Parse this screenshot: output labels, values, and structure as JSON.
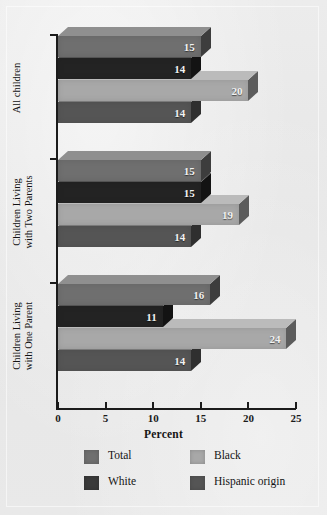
{
  "chart_data": {
    "type": "bar",
    "orientation": "horizontal",
    "title": "",
    "xlabel": "Percent",
    "ylabel": "",
    "xlim": [
      0,
      25
    ],
    "xticks": [
      0,
      5,
      10,
      15,
      20,
      25
    ],
    "grid": false,
    "legend_position": "bottom",
    "categories": [
      "All children",
      "Children Living\nwith Two Parents",
      "Children Living\nwith One Parent"
    ],
    "series": [
      {
        "name": "Total",
        "color": "#6f6f6f",
        "values": [
          15,
          15,
          16
        ]
      },
      {
        "name": "White",
        "color": "#232323",
        "values": [
          14,
          15,
          11
        ]
      },
      {
        "name": "Black",
        "color": "#a8a8a8",
        "values": [
          20,
          19,
          24
        ]
      },
      {
        "name": "Hispanic origin",
        "color": "#555555",
        "values": [
          14,
          14,
          14
        ]
      }
    ],
    "legend_entries": [
      {
        "label": "Total",
        "color": "#6f6f6f"
      },
      {
        "label": "Black",
        "color": "#a8a8a8"
      },
      {
        "label": "White",
        "color": "#3a3a3a"
      },
      {
        "label": "Hispanic origin",
        "color": "#555555"
      }
    ],
    "data_labels": [
      [
        15,
        14,
        20,
        14
      ],
      [
        15,
        15,
        19,
        14
      ],
      [
        16,
        11,
        24,
        14
      ]
    ]
  },
  "axis": {
    "x_tick_labels": [
      "0",
      "5",
      "10",
      "15",
      "20",
      "25"
    ],
    "x_title": "Percent"
  },
  "colors": {
    "background": "#e8e8e8",
    "axis": "#1b1b1b",
    "label_text": "#121212",
    "value_text": "#f2f2f2"
  }
}
